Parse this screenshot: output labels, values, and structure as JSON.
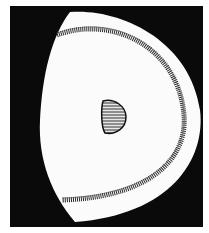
{
  "figure": {
    "colors": {
      "background": "#ffffff",
      "field": "#0a0a0a",
      "cell": "#fbfbfb",
      "hatch": "#2a2a2a",
      "nucleus_fill": "#8a8a8a"
    },
    "parts": [
      {
        "name": "dark-field",
        "label": ""
      },
      {
        "name": "cell-body",
        "label": ""
      },
      {
        "name": "peripheral-band",
        "label": ""
      },
      {
        "name": "nucleus",
        "label": ""
      }
    ]
  }
}
